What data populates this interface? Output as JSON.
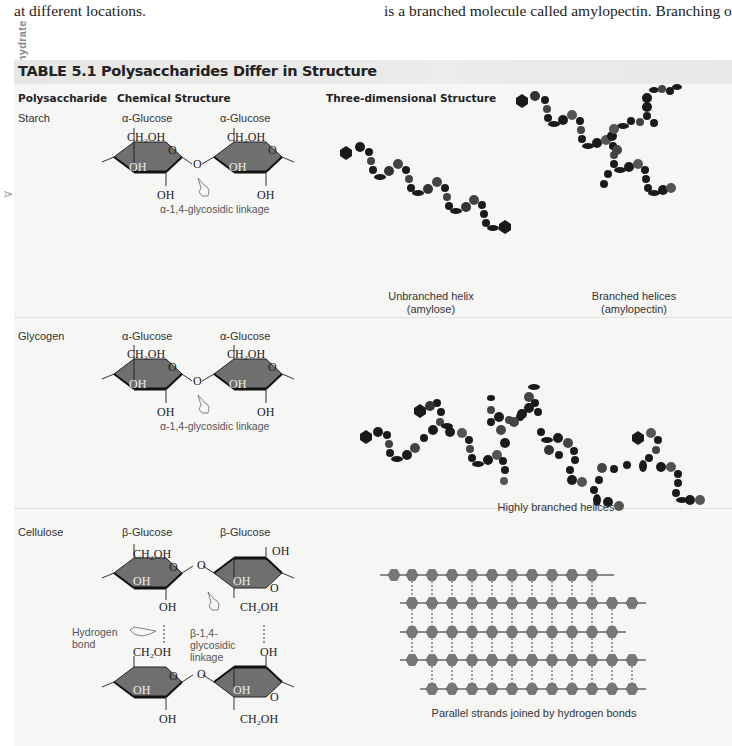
{
  "page": {
    "body_text_left": "at different locations.",
    "body_text_right": "is a branched molecule called amylopectin. Branching occurs",
    "side_tab": "Carbohydrate"
  },
  "table": {
    "title": "TABLE 5.1 Polysaccharides Differ in Structure",
    "columns": [
      "Polysaccharide",
      "Chemical Structure",
      "Three-dimensional Structure"
    ],
    "colors": {
      "title_bar": "#e8e8e6",
      "background": "#f6f6f5",
      "ring_fill": "#6f6f6f",
      "ring_dark": "#1a1a1a",
      "bead_dark": "#111111",
      "bead_mid": "#444444",
      "strand_bead": "#777777"
    },
    "rows": [
      {
        "name": "Starch",
        "monomer_left": "α-Glucose",
        "monomer_right": "α-Glucose",
        "groups": {
          "ch2oh": "CH₂OH",
          "oh": "OH",
          "o": "O"
        },
        "linkage": "α-1,4-glycosidic linkage",
        "structures": [
          {
            "caption_line1": "Unbranched helix",
            "caption_line2": "(amylose)"
          },
          {
            "caption_line1": "Branched helices",
            "caption_line2": "(amylopectin)"
          }
        ]
      },
      {
        "name": "Glycogen",
        "monomer_left": "α-Glucose",
        "monomer_right": "α-Glucose",
        "groups": {
          "ch2oh": "CH₂OH",
          "oh": "OH",
          "o": "O"
        },
        "linkage": "α-1,4-glycosidic linkage",
        "structures": [
          {
            "caption_line1": "Highly branched helices"
          }
        ]
      },
      {
        "name": "Cellulose",
        "monomer_left": "β-Glucose",
        "monomer_right": "β-Glucose",
        "groups": {
          "ch2oh": "CH₂OH",
          "oh": "OH",
          "o": "O"
        },
        "hydrogen_bond_line1": "Hydrogen",
        "hydrogen_bond_line2": "bond",
        "linkage_line1": "β-1,4-",
        "linkage_line2": "glycosidic",
        "linkage_line3": "linkage",
        "structures": [
          {
            "caption_line1": "Parallel strands joined by hydrogen bonds"
          }
        ]
      }
    ]
  }
}
